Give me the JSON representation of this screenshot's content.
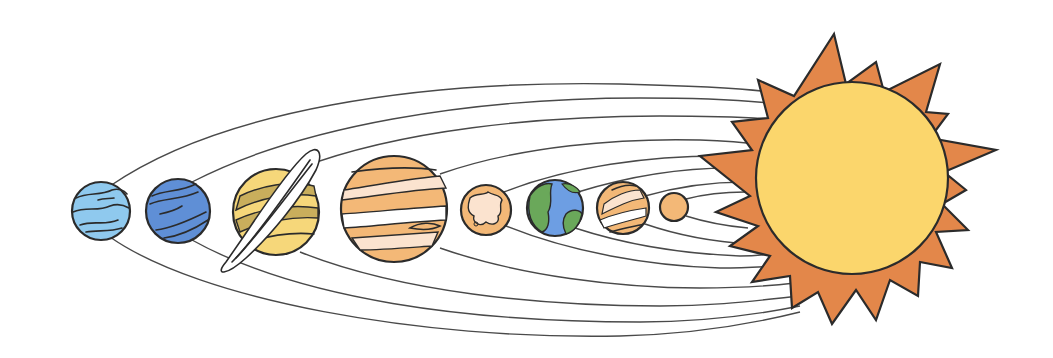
{
  "illustration": {
    "title": "Solar System",
    "background": "#ffffff",
    "sun": {
      "name": "Sun",
      "corona_color": "#e3874a",
      "disc_color": "#fbd66c",
      "cx": 852,
      "cy": 178,
      "r": 96
    },
    "planets": [
      {
        "name": "Neptune",
        "order_from_left": 1,
        "cx": 101,
        "cy": 211,
        "r": 29,
        "base_color": "#8fc9ee",
        "band_color": "#5aa3d8"
      },
      {
        "name": "Uranus",
        "order_from_left": 2,
        "cx": 178,
        "cy": 211,
        "r": 32,
        "base_color": "#5f8fd6",
        "band_color": "#8ab4ea"
      },
      {
        "name": "Saturn",
        "order_from_left": 3,
        "cx": 276,
        "cy": 212,
        "r": 43,
        "base_color": "#f6d77a",
        "band_color": "#c9ae5c",
        "has_rings": true
      },
      {
        "name": "Jupiter",
        "order_from_left": 4,
        "cx": 394,
        "cy": 209,
        "r": 53,
        "base_color": "#f3b877",
        "band_color": "#fbe3cf"
      },
      {
        "name": "Mars",
        "order_from_left": 5,
        "cx": 486,
        "cy": 210,
        "r": 25,
        "base_color": "#f3b877",
        "band_color": "#fbe3cf"
      },
      {
        "name": "Earth",
        "order_from_left": 6,
        "cx": 555,
        "cy": 208,
        "r": 28,
        "base_color": "#6d9ee3",
        "band_color": "#6aa85a"
      },
      {
        "name": "Venus",
        "order_from_left": 7,
        "cx": 623,
        "cy": 208,
        "r": 26,
        "base_color": "#f3b877",
        "band_color": "#fbe3cf"
      },
      {
        "name": "Mercury",
        "order_from_left": 8,
        "cx": 674,
        "cy": 207,
        "r": 14,
        "base_color": "#f3b877"
      }
    ],
    "orbit_count": 8,
    "orbit_color": "#4a4a4a"
  }
}
